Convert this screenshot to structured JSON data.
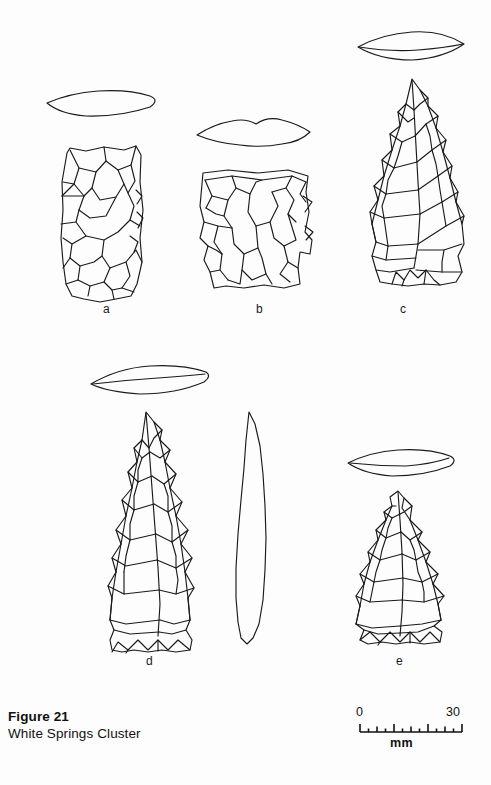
{
  "figure": {
    "caption_title": "Figure 21",
    "caption_subtitle": "White Springs Cluster",
    "background_color": "#fdfdfd",
    "ink_color": "#1a1a1a"
  },
  "scale_bar": {
    "min_label": "0",
    "max_label": "30",
    "unit_label": "mm",
    "min_value": 0,
    "max_value": 30,
    "major_tick_values": [
      0,
      5,
      10,
      15,
      20,
      25,
      30
    ],
    "minor_tick_values": [
      2.5,
      7.5,
      12.5,
      17.5,
      22.5,
      27.5
    ]
  },
  "artifacts": [
    {
      "label": "a",
      "description": "rectangular biface preform, squared base and lateral margins",
      "cross_section": "flattened-lenticular",
      "label_x": 103,
      "label_y": 307
    },
    {
      "label": "b",
      "description": "basal fragment with squared shoulders and snapped distal end",
      "cross_section": "irregular-flattened",
      "label_x": 256,
      "label_y": 307
    },
    {
      "label": "c",
      "description": "triangular hafted biface with contracting stem",
      "cross_section": "biconvex-lenticular",
      "label_x": 400,
      "label_y": 307
    },
    {
      "label": "d",
      "description": "elongate triangular hafted biface with straight base",
      "cross_section": "thin-lenticular",
      "label_x": 146,
      "label_y": 659
    },
    {
      "label": "e",
      "description": "triangular hafted biface with slight side notches",
      "cross_section": "flattened-lenticular",
      "label_x": 396,
      "label_y": 659
    }
  ]
}
